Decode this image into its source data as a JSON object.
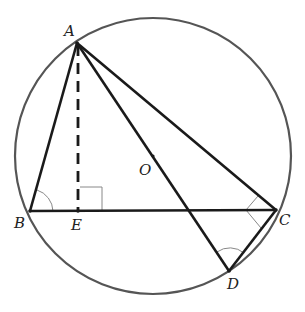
{
  "diagram": {
    "type": "geometry-figure",
    "colors": {
      "circle": "#555555",
      "segments": "#1a1a1a",
      "angle_marks": "#888888",
      "labels": "#222222"
    },
    "circle": {
      "center": "O",
      "cx": 153,
      "cy": 156,
      "r": 138
    },
    "points": [
      {
        "id": "A",
        "label": "A",
        "x": 77,
        "y": 43,
        "lx": 64,
        "ly": 24
      },
      {
        "id": "B",
        "label": "B",
        "x": 30,
        "y": 211,
        "lx": 14,
        "ly": 216
      },
      {
        "id": "E",
        "label": "E",
        "x": 78,
        "y": 211,
        "lx": 71,
        "ly": 218
      },
      {
        "id": "C",
        "label": "C",
        "x": 276,
        "y": 210,
        "lx": 279,
        "ly": 213
      },
      {
        "id": "D",
        "label": "D",
        "x": 229,
        "y": 271,
        "lx": 227,
        "ly": 277
      },
      {
        "id": "O",
        "label": "O",
        "x": 153,
        "y": 156,
        "lx": 139,
        "ly": 163
      }
    ],
    "segments": [
      {
        "from": "A",
        "to": "B",
        "style": "solid"
      },
      {
        "from": "A",
        "to": "C",
        "style": "solid"
      },
      {
        "from": "B",
        "to": "C",
        "style": "solid"
      },
      {
        "from": "A",
        "to": "D",
        "style": "solid"
      },
      {
        "from": "C",
        "to": "D",
        "style": "solid"
      },
      {
        "from": "A",
        "to": "E",
        "style": "dashed"
      }
    ],
    "marks": [
      {
        "type": "right-angle",
        "at": "E"
      },
      {
        "type": "angle-arc",
        "at": "B"
      },
      {
        "type": "right-angle",
        "at": "C",
        "between": [
          "A",
          "D"
        ]
      },
      {
        "type": "angle-arc",
        "at": "D"
      }
    ]
  }
}
